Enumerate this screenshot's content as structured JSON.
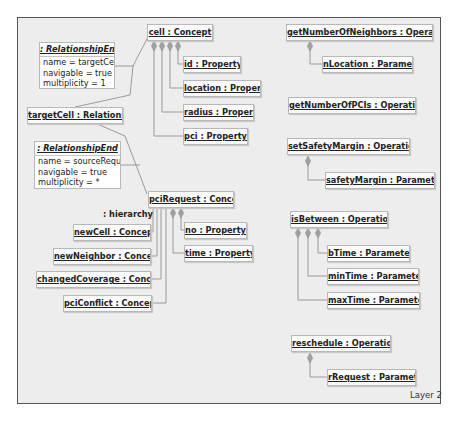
{
  "layer_label": "Layer 2",
  "hierarchy_label": ": hierarchy",
  "concepts": {
    "cell": "cell : Concept",
    "pciRequest": "pciRequest : Concept",
    "newCell": "newCell : Concept",
    "newNeighbor": "newNeighbor : Concept",
    "changedCoverage": "changedCoverage : Concept",
    "pciConflict": "pciConflict : Concept"
  },
  "properties": {
    "id": "id : Property",
    "location": "location : Property",
    "radius": "radius : Property",
    "pci": "pci : Property",
    "no": "no : Property",
    "time": "time : Property"
  },
  "relationship": {
    "label": "targetCell : Relationship",
    "ends": [
      {
        "header": ": RelationshipEnd",
        "name": "name = targetCell",
        "navigable": "navigable = true",
        "multiplicity": "multiplicity = 1"
      },
      {
        "header": ": RelationshipEnd",
        "name": "name = sourceRequest",
        "navigable": "navigable = true",
        "multiplicity": "multiplicity = *"
      }
    ]
  },
  "operations": {
    "getNumberOfNeighbors": "getNumberOfNeighbors : Operation",
    "getNumberOfPCIs": "getNumberOfPCIs : Operation",
    "setSafetyMargin": "setSafetyMargin : Operation",
    "isBetween": "isBetween : Operation",
    "reschedule": "reschedule : Operation"
  },
  "parameters": {
    "nLocation": "nLocation : Parameter",
    "safetyMargin": "safetyMargin : Parameter",
    "bTime": "bTime : Parameter",
    "minTime": "minTime : Parameter",
    "maxTime": "maxTime : Parameter",
    "rRequest": "rRequest : Parameter"
  },
  "colors": {
    "canvas": "#ededed",
    "box_fill": "#fafafa",
    "box_border": "#b8b8b8",
    "wire": "#9a9a9a",
    "diamond": "#a0a0a0",
    "frame_border": "#555555"
  }
}
